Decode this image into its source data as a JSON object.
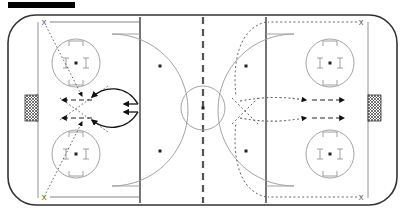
{
  "diagram": {
    "title_bar": {
      "label": "",
      "color": "#000000"
    },
    "sport": "ice hockey",
    "type": "drill-diagram",
    "surface": {
      "name": "full-ice-rink",
      "background_color": "#ffffff",
      "board_color": "#333333",
      "line_color": "#808080",
      "blue_line_color": "#666666",
      "center_line_color": "#555555",
      "goal_line_color": "#888888"
    },
    "zones": [
      {
        "name": "left-defensive-zone",
        "goal_side": "left"
      },
      {
        "name": "neutral-zone",
        "goal_side": "none"
      },
      {
        "name": "right-defensive-zone",
        "goal_side": "right"
      }
    ],
    "markings": {
      "center_circle": {
        "name": "center-ice-circle",
        "cx": 203,
        "cy": 108,
        "r": 22
      },
      "center_line": {
        "name": "center-red-line",
        "x": 203,
        "style": "dashed"
      },
      "blue_lines": [
        {
          "name": "left-blue-line",
          "x": 140
        },
        {
          "name": "right-blue-line",
          "x": 266
        }
      ],
      "goal_lines": [
        {
          "name": "left-goal-line",
          "x": 38
        },
        {
          "name": "right-goal-line",
          "x": 368
        }
      ],
      "faceoff_circles": [
        {
          "name": "faceoff-circle-left-top",
          "cx": 76,
          "cy": 63,
          "r": 24
        },
        {
          "name": "faceoff-circle-left-bottom",
          "cx": 76,
          "cy": 154,
          "r": 24
        },
        {
          "name": "faceoff-circle-right-top",
          "cx": 330,
          "cy": 63,
          "r": 24
        },
        {
          "name": "faceoff-circle-right-bottom",
          "cx": 330,
          "cy": 154,
          "r": 24
        }
      ],
      "neutral_dots": [
        {
          "name": "neutral-dot-top-left",
          "cx": 160,
          "cy": 66
        },
        {
          "name": "neutral-dot-bottom-left",
          "cx": 160,
          "cy": 151
        },
        {
          "name": "neutral-dot-top-right",
          "cx": 246,
          "cy": 66
        },
        {
          "name": "neutral-dot-bottom-right",
          "cx": 246,
          "cy": 151
        }
      ],
      "goals": [
        {
          "name": "goal-net-left",
          "side": "left",
          "x": 24,
          "y": 94,
          "w": 14,
          "h": 28
        },
        {
          "name": "goal-net-right",
          "side": "right",
          "x": 368,
          "y": 94,
          "w": 14,
          "h": 28
        }
      ],
      "creases": [
        {
          "name": "crease-left",
          "side": "left"
        },
        {
          "name": "crease-right",
          "side": "right"
        }
      ]
    },
    "players": [
      {
        "name": "player-x-top-left",
        "label": "X",
        "x": 44,
        "y": 22
      },
      {
        "name": "player-x-bottom-left",
        "label": "X",
        "x": 44,
        "y": 197
      },
      {
        "name": "player-x-top-right",
        "label": "X",
        "x": 361,
        "y": 22
      },
      {
        "name": "player-x-bottom-right",
        "label": "X",
        "x": 361,
        "y": 197
      }
    ],
    "paths": {
      "solid_label": "puck / shot path (solid)",
      "dotted_label": "skating path (dotted)",
      "dashed_label": "pass (dashed)",
      "left_side_style": "solid",
      "right_side_style": "dotted"
    },
    "legend_visible": false
  }
}
